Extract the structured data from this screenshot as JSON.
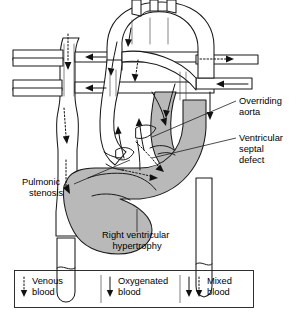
{
  "figure": {
    "type": "anatomical-diagram",
    "colors": {
      "wall_fill": "#b9b9b9",
      "lumen_fill": "#ffffff",
      "outline": "#1a1a1a",
      "background": "#ffffff"
    }
  },
  "annotations": [
    {
      "id": "overriding-aorta",
      "lines": [
        "Overriding",
        "aorta"
      ],
      "text": "Overriding aorta",
      "label_x": 239,
      "label_y": 104,
      "anchor_x": 152,
      "anchor_y": 137
    },
    {
      "id": "ventricular-septal-defect",
      "lines": [
        "Ventricular",
        "septal",
        "defect"
      ],
      "text": "Ventricular septal defect",
      "label_x": 239,
      "label_y": 141,
      "anchor_x": 152,
      "anchor_y": 158
    },
    {
      "id": "pulmonic-stenosis",
      "lines": [
        "Pulmonic",
        "stenosis"
      ],
      "text": "Pulmonic stenosis",
      "label_x": 22,
      "label_y": 185,
      "anchor_x": 108,
      "anchor_y": 163
    },
    {
      "id": "right-ventricular-hypertrophy",
      "lines": [
        "Right ventricular",
        "hypertrophy"
      ],
      "text": "Right ventricular hypertrophy",
      "label_x": 90,
      "label_y": 238,
      "anchor_x": 137,
      "anchor_y": 210
    }
  ],
  "legend": {
    "items": [
      {
        "id": "venous",
        "lines": [
          "Venous",
          "blood"
        ],
        "text": "Venous blood",
        "arrow_style": "dotted",
        "arrow_count": 1
      },
      {
        "id": "oxygenated",
        "lines": [
          "Oxygenated",
          "blood"
        ],
        "text": "Oxygenated blood",
        "arrow_style": "solid",
        "arrow_count": 1
      },
      {
        "id": "mixed",
        "lines": [
          "Mixed",
          "blood"
        ],
        "text": "Mixed blood",
        "arrow_style": "solid-and-dotted",
        "arrow_count": 2
      }
    ]
  }
}
